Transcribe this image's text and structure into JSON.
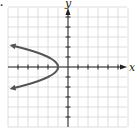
{
  "problem_marker": ".",
  "chart_data": {
    "type": "line",
    "title": "",
    "xlabel": "x",
    "ylabel": "y",
    "xlim": [
      -6,
      6
    ],
    "ylim": [
      -6,
      6
    ],
    "grid": true,
    "tick_spacing": 1,
    "series": [
      {
        "name": "x = -y^2 - 1",
        "x": [
          -5.8,
          -5,
          -3.25,
          -2,
          -1.25,
          -1,
          -1.25,
          -2,
          -3.25,
          -5,
          -5.8
        ],
        "y": [
          2.2,
          2,
          1.5,
          1,
          0.5,
          0,
          -0.5,
          -1,
          -1.5,
          -2,
          -2.2
        ],
        "arrows": "both-ends",
        "vertex": [
          -1,
          0
        ],
        "opens": "left"
      }
    ]
  },
  "colors": {
    "grid": "#d6d6d6",
    "axis": "#222222",
    "curve": "#555555"
  }
}
